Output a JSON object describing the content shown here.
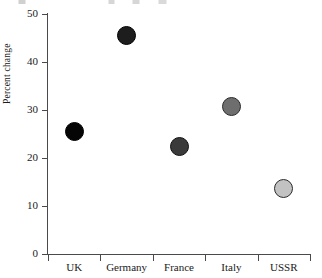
{
  "chart_data": {
    "type": "scatter",
    "title": "",
    "xlabel": "",
    "ylabel": "Percent change",
    "categories": [
      "UK",
      "Germany",
      "France",
      "Italy",
      "USSR"
    ],
    "values": [
      25.5,
      45.5,
      22.5,
      30.8,
      13.7
    ],
    "ylim": [
      0,
      50
    ],
    "yticks": [
      0,
      10,
      20,
      30,
      40,
      50
    ],
    "ytick_labels": [
      "0",
      "10",
      "20",
      "30",
      "40",
      "50"
    ],
    "grid": false,
    "legend": "none",
    "marker": "filled-circle",
    "series": [
      {
        "name": "Percent change",
        "points": [
          {
            "category": "UK",
            "value": 25.5,
            "fill": "#050505",
            "stroke": "#000000"
          },
          {
            "category": "Germany",
            "value": 45.5,
            "fill": "#1d1d1d",
            "stroke": "#000000"
          },
          {
            "category": "France",
            "value": 22.5,
            "fill": "#3a3a3a",
            "stroke": "#111111"
          },
          {
            "category": "Italy",
            "value": 30.8,
            "fill": "#6e6e6e",
            "stroke": "#2a2a2a"
          },
          {
            "category": "USSR",
            "value": 13.7,
            "fill": "#c2c2c2",
            "stroke": "#2a2a2a"
          }
        ]
      }
    ]
  },
  "axes": {
    "line_color": "#4a4a4a",
    "text_color": "#1a1a1a"
  }
}
